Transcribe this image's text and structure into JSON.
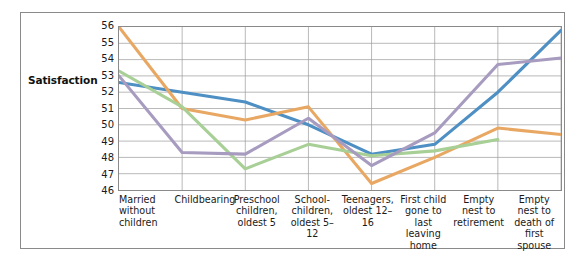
{
  "figure": {
    "axis_title_y": "Satisfaction"
  },
  "chart_data": {
    "type": "line",
    "title": "",
    "xlabel": "",
    "ylabel": "Satisfaction",
    "ylim": [
      46,
      56
    ],
    "y_ticks": [
      56,
      55,
      54,
      53,
      52,
      51,
      50,
      49,
      48,
      47,
      46
    ],
    "grid": true,
    "legend": "none",
    "categories": [
      "Married without children",
      "Childbearing",
      "Preschool children, oldest 5",
      "School-children, oldest 5–12",
      "Teenagers, oldest 12–16",
      "First child gone to last leaving home",
      "Empty nest to retirement",
      "Empty nest to death of first spouse"
    ],
    "series": [
      {
        "name": "series-blue",
        "color": "#4e8fc4",
        "values": [
          52.6,
          52.0,
          51.4,
          50.0,
          48.2,
          48.8,
          52.0,
          55.8
        ]
      },
      {
        "name": "series-orange",
        "color": "#e8a863",
        "values": [
          56.0,
          51.0,
          50.3,
          51.1,
          46.4,
          48.0,
          49.8,
          49.4
        ]
      },
      {
        "name": "series-green",
        "color": "#a8cf96",
        "values": [
          53.3,
          51.1,
          47.3,
          48.8,
          48.1,
          48.4,
          49.1,
          null
        ]
      },
      {
        "name": "series-purple",
        "color": "#a79cc0",
        "values": [
          53.0,
          48.3,
          48.2,
          50.4,
          47.5,
          49.5,
          53.7,
          54.1
        ]
      }
    ]
  }
}
